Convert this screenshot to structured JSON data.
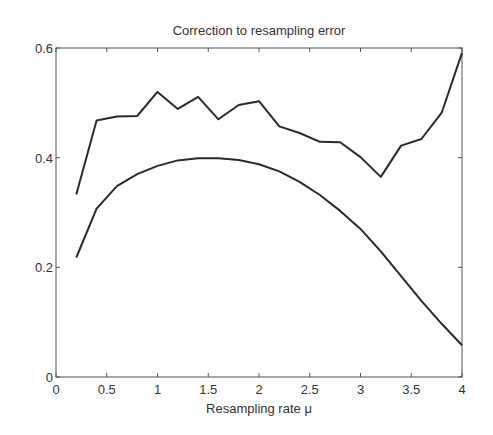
{
  "chart_data": {
    "type": "line",
    "title": "Correction to resampling error",
    "xlabel": "Resampling rate μ",
    "ylabel": "",
    "xlim": [
      0,
      4
    ],
    "ylim": [
      0,
      0.6
    ],
    "xticks": [
      0,
      0.5,
      1,
      1.5,
      2,
      2.5,
      3,
      3.5,
      4
    ],
    "xtick_labels": [
      "0",
      "0.5",
      "1",
      "1.5",
      "2",
      "2.5",
      "3",
      "3.5",
      "4"
    ],
    "yticks": [
      0,
      0.2,
      0.4,
      0.6
    ],
    "ytick_labels": [
      "0",
      "0.2",
      "0.4",
      "0.6"
    ],
    "grid": false,
    "legend": null,
    "series": [
      {
        "name": "upper (noisy)",
        "color": "#2a2a2a",
        "x": [
          0.2,
          0.4,
          0.6,
          0.8,
          1.0,
          1.2,
          1.4,
          1.6,
          1.8,
          2.0,
          2.2,
          2.4,
          2.6,
          2.8,
          3.0,
          3.2,
          3.4,
          3.6,
          3.8,
          4.0
        ],
        "y": [
          0.333,
          0.468,
          0.475,
          0.476,
          0.52,
          0.489,
          0.511,
          0.47,
          0.496,
          0.503,
          0.457,
          0.445,
          0.429,
          0.428,
          0.401,
          0.365,
          0.422,
          0.434,
          0.482,
          0.591
        ]
      },
      {
        "name": "lower (smooth)",
        "color": "#2a2a2a",
        "x": [
          0.2,
          0.4,
          0.6,
          0.8,
          1.0,
          1.2,
          1.4,
          1.6,
          1.8,
          2.0,
          2.2,
          2.4,
          2.6,
          2.8,
          3.0,
          3.2,
          3.4,
          3.6,
          3.8,
          4.0
        ],
        "y": [
          0.218,
          0.307,
          0.348,
          0.37,
          0.385,
          0.395,
          0.399,
          0.399,
          0.396,
          0.388,
          0.375,
          0.356,
          0.332,
          0.303,
          0.27,
          0.229,
          0.184,
          0.139,
          0.097,
          0.058
        ]
      }
    ]
  }
}
